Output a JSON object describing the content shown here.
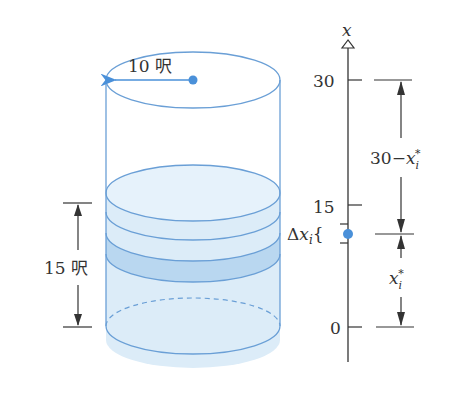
{
  "diagram": {
    "radius_label": "10 呎",
    "height_label": "15 呎",
    "axis": {
      "variable": "x",
      "ticks": [
        {
          "label": "30",
          "value": 30
        },
        {
          "label": "15",
          "value": 15
        },
        {
          "label": "0",
          "value": 0
        }
      ]
    },
    "slice_label_prefix": "Δ",
    "slice_label_var": "x",
    "slice_label_sub": "i",
    "slice_label_brace": "{",
    "upper_dim": {
      "prefix": "30−",
      "var": "x",
      "sub": "i",
      "sup": "*"
    },
    "lower_dim": {
      "var": "x",
      "sub": "i",
      "sup": "*"
    },
    "colors": {
      "cylinder_outline": "#6a9fd6",
      "water_fill": "#dcecf8",
      "slice_fill": "#b9d7f0",
      "dot": "#4a90d9",
      "axis": "#333333"
    }
  }
}
